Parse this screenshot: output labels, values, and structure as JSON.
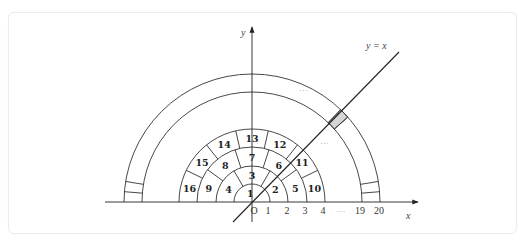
{
  "diagram": {
    "origin": {
      "x": 252,
      "y": 202
    },
    "axes": {
      "x_label": "x",
      "y_label": "y",
      "origin_label": "O",
      "x_axis_from": 105,
      "x_axis_to": 418,
      "y_axis_top": 27,
      "y_axis_bottom": 222
    },
    "line": {
      "label": "y = x",
      "x1": 233,
      "y1": 222,
      "x2": 399,
      "y2": 52
    },
    "inner_rings": [
      {
        "r_in": 0,
        "r_out": 18,
        "cells": 1,
        "labels": [
          "1"
        ]
      },
      {
        "r_in": 18,
        "r_out": 36,
        "cells": 3,
        "labels": [
          "2",
          "3",
          "4"
        ]
      },
      {
        "r_in": 36,
        "r_out": 55,
        "cells": 5,
        "labels": [
          "5",
          "6",
          "7",
          "8",
          "9"
        ]
      },
      {
        "r_in": 55,
        "r_out": 73,
        "cells": 7,
        "labels": [
          "10",
          "11",
          "12",
          "13",
          "14",
          "15",
          "16"
        ]
      }
    ],
    "outer_ring": {
      "r_in": 110,
      "r_out": 128,
      "cells": 39,
      "shaded_cell_index": 9,
      "visible_dividers": [
        1,
        2,
        9,
        10,
        37,
        38
      ]
    },
    "x_ticks": [
      {
        "label": "O",
        "x": 254
      },
      {
        "label": "1",
        "x": 268
      },
      {
        "label": "2",
        "x": 287
      },
      {
        "label": "3",
        "x": 305
      },
      {
        "label": "4",
        "x": 323
      },
      {
        "label": "···",
        "x": 341
      },
      {
        "label": "19",
        "x": 360
      },
      {
        "label": "20",
        "x": 379
      }
    ],
    "ellipsis_labels": [
      {
        "text": "···",
        "x": 299,
        "y": 93
      },
      {
        "text": "···",
        "x": 320,
        "y": 146
      }
    ]
  }
}
